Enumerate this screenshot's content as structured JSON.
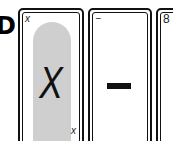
{
  "edge_letter": "D",
  "cards": [
    {
      "corner_top": "x",
      "face": "X",
      "corner_bottom": "x",
      "highlighted": true
    },
    {
      "corner_top": "−",
      "face": "−"
    },
    {
      "corner_top": "8"
    }
  ],
  "colors": {
    "highlight": "#cfcfcf",
    "ink": "#111111"
  }
}
